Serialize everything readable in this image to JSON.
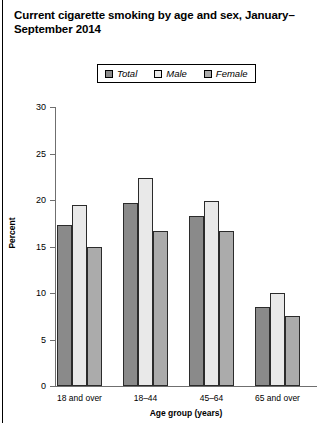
{
  "chart_data": {
    "type": "bar",
    "title": "Current cigarette smoking by age and sex, January–September 2014",
    "xlabel": "Age group (years)",
    "ylabel": "Percent",
    "ylim": [
      0,
      30
    ],
    "yticks": [
      0,
      5,
      10,
      15,
      20,
      25,
      30
    ],
    "grid": false,
    "legend_position": "top-center",
    "categories": [
      "18 and over",
      "18–44",
      "45–64",
      "65 and over"
    ],
    "series": [
      {
        "name": "Total",
        "values": [
          17.3,
          19.7,
          18.3,
          8.5
        ],
        "color": "#8a8a8a"
      },
      {
        "name": "Male",
        "values": [
          19.5,
          22.4,
          19.9,
          10.0
        ],
        "color": "#e9e9e9"
      },
      {
        "name": "Female",
        "values": [
          15.0,
          16.7,
          16.7,
          7.5
        ],
        "color": "#ababab"
      }
    ]
  },
  "legend": {
    "items": [
      {
        "label": "Total",
        "color": "#8a8a8a"
      },
      {
        "label": "Male",
        "color": "#e9e9e9"
      },
      {
        "label": "Female",
        "color": "#ababab"
      }
    ]
  }
}
